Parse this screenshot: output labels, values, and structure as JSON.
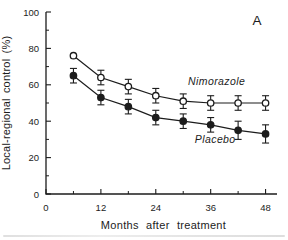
{
  "figure": {
    "panel_label": "A",
    "background": "#ffffff",
    "ink_color": "#1c1c1c"
  },
  "chart_data": {
    "type": "line",
    "title": "",
    "panel_label": "A",
    "xlabel": "Months after treatment",
    "ylabel": "Local-regional control (%)",
    "xlim": [
      0,
      50.5
    ],
    "ylim": [
      0,
      100
    ],
    "grid": false,
    "legend": "inline-annotations",
    "x_major_ticks": [
      0,
      12,
      24,
      36,
      48
    ],
    "x_minor_ticks": [
      6,
      18,
      30,
      42
    ],
    "y_major_ticks": [
      0,
      20,
      40,
      60,
      80,
      100
    ],
    "y_minor_ticks": [
      10,
      30,
      50,
      70,
      90
    ],
    "x": [
      6,
      12,
      18,
      24,
      30,
      36,
      42,
      48
    ],
    "series": [
      {
        "name": "Nimorazole",
        "marker": "open-circle",
        "values": [
          76,
          64,
          59,
          54,
          51,
          50,
          50,
          50
        ],
        "errors": [
          0,
          4,
          4,
          4,
          4,
          4,
          4,
          4
        ],
        "label": {
          "x": 37.3,
          "y": 60
        }
      },
      {
        "name": "Placebo",
        "marker": "filled-circle",
        "values": [
          65,
          53,
          48,
          42,
          40,
          38,
          35,
          33
        ],
        "errors": [
          4,
          4,
          4,
          4,
          4,
          4,
          5,
          5
        ],
        "label": {
          "x": 37.0,
          "y": 28
        }
      }
    ]
  }
}
